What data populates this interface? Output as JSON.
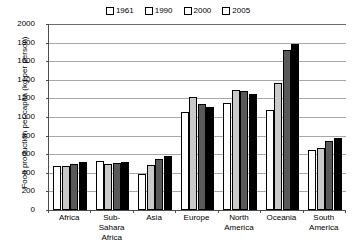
{
  "chart_data": {
    "type": "bar",
    "title": "",
    "xlabel": "",
    "ylabel": "Food production per-capita (kg per person)",
    "ylim": [
      0,
      2000
    ],
    "ytick_step": 200,
    "yticks": [
      2000,
      1800,
      1600,
      1400,
      1200,
      1000,
      800,
      600,
      400,
      200,
      0
    ],
    "grid": true,
    "legend_position": "top-center",
    "categories": [
      "Africa",
      "Sub-Sahara\nAfrica",
      "Asia",
      "Europe",
      "North America",
      "Oceania",
      "South America"
    ],
    "series": [
      {
        "name": "1961",
        "color": "#ffffff",
        "values": [
          470,
          530,
          385,
          1050,
          1150,
          1080,
          650
        ]
      },
      {
        "name": "1990",
        "color": "#c9c9c9",
        "values": [
          475,
          495,
          480,
          1210,
          1290,
          1370,
          665
        ]
      },
      {
        "name": "2000",
        "color": "#595959",
        "values": [
          500,
          505,
          545,
          1140,
          1280,
          1720,
          745
        ]
      },
      {
        "name": "2005",
        "color": "#000000",
        "values": [
          520,
          520,
          580,
          1110,
          1250,
          1790,
          775
        ]
      }
    ]
  },
  "legend": {
    "entries": [
      {
        "label": "1961"
      },
      {
        "label": "1990"
      },
      {
        "label": "2000"
      },
      {
        "label": "2005"
      }
    ]
  },
  "axes": {
    "y_axis_title": "Food production per-capita (kg per person)"
  }
}
